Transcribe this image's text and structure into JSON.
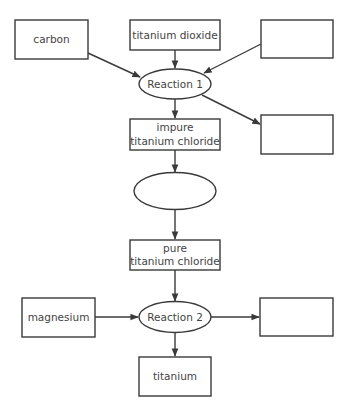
{
  "diagram": {
    "type": "flowchart",
    "title": "",
    "colors": {
      "stroke": "#3a3a3a",
      "text": "#444444",
      "background": "#ffffff"
    },
    "nodes": {
      "carbon": {
        "shape": "rect",
        "line1": "carbon",
        "line2": ""
      },
      "titanium_dioxide": {
        "shape": "rect",
        "line1": "titanium dioxide",
        "line2": ""
      },
      "blank_top_right": {
        "shape": "rect",
        "line1": "",
        "line2": ""
      },
      "reaction1": {
        "shape": "ellipse",
        "line1": "Reaction 1",
        "line2": ""
      },
      "blank_right_mid": {
        "shape": "rect",
        "line1": "",
        "line2": ""
      },
      "impure_ticl": {
        "shape": "rect",
        "line1": "impure",
        "line2": "titanium chloride"
      },
      "blank_ellipse": {
        "shape": "ellipse",
        "line1": "",
        "line2": ""
      },
      "pure_ticl": {
        "shape": "rect",
        "line1": "pure",
        "line2": "titanium chloride"
      },
      "magnesium": {
        "shape": "rect",
        "line1": "magnesium",
        "line2": ""
      },
      "reaction2": {
        "shape": "ellipse",
        "line1": "Reaction 2",
        "line2": ""
      },
      "blank_bottom_right": {
        "shape": "rect",
        "line1": "",
        "line2": ""
      },
      "titanium": {
        "shape": "rect",
        "line1": "titanium",
        "line2": ""
      }
    },
    "edges": [
      {
        "from": "carbon",
        "to": "reaction1"
      },
      {
        "from": "titanium_dioxide",
        "to": "reaction1"
      },
      {
        "from": "blank_top_right",
        "to": "reaction1"
      },
      {
        "from": "reaction1",
        "to": "blank_right_mid"
      },
      {
        "from": "reaction1",
        "to": "impure_ticl"
      },
      {
        "from": "impure_ticl",
        "to": "blank_ellipse"
      },
      {
        "from": "blank_ellipse",
        "to": "pure_ticl"
      },
      {
        "from": "pure_ticl",
        "to": "reaction2"
      },
      {
        "from": "magnesium",
        "to": "reaction2"
      },
      {
        "from": "reaction2",
        "to": "blank_bottom_right"
      },
      {
        "from": "reaction2",
        "to": "titanium"
      }
    ]
  }
}
